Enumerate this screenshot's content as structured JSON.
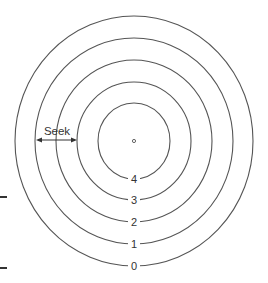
{
  "diagram": {
    "center_marker": "spindle-center",
    "tracks": [
      {
        "label": "0",
        "rx": 119,
        "ry": 125
      },
      {
        "label": "1",
        "rx": 99,
        "ry": 103
      },
      {
        "label": "2",
        "rx": 78,
        "ry": 81
      },
      {
        "label": "3",
        "rx": 57,
        "ry": 59
      },
      {
        "label": "4",
        "rx": 36,
        "ry": 38
      }
    ],
    "seek_label": "Seek",
    "colors": {
      "stroke": "#555555",
      "text": "#333333",
      "background": "#ffffff"
    }
  }
}
